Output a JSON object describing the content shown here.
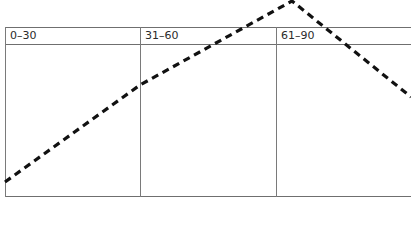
{
  "table": {
    "columns": [
      {
        "label": "0–30"
      },
      {
        "label": "31–60"
      },
      {
        "label": "61–90"
      }
    ]
  },
  "line": {
    "style": "dashed",
    "color": "#111111",
    "points": [
      [
        5,
        182
      ],
      [
        140,
        85
      ],
      [
        292,
        1
      ],
      [
        411,
        97
      ]
    ]
  },
  "colors": {
    "border": "#6f6f6f",
    "text": "#2a2a2a",
    "background": "#ffffff"
  }
}
